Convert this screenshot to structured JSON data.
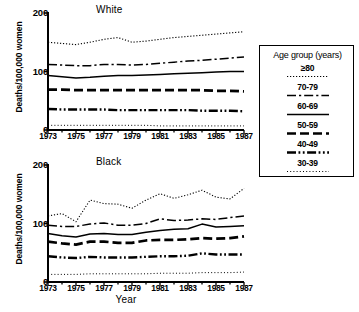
{
  "figure": {
    "xlabel": "Year",
    "ylabel": "Deaths/100,000 women"
  },
  "legend": {
    "title": "Age group (years)",
    "entries": [
      {
        "label": "≥80",
        "style": "dotted-fine"
      },
      {
        "label": "70-79",
        "style": "dash-dot"
      },
      {
        "label": "60-69",
        "style": "solid"
      },
      {
        "label": "50-59",
        "style": "dashed-thick"
      },
      {
        "label": "40-49",
        "style": "dash-dot-dot-thick"
      },
      {
        "label": "30-39",
        "style": "dotted-sparse"
      }
    ]
  },
  "chart_data": [
    {
      "type": "line",
      "title": "White",
      "xlabel": "Year",
      "ylabel": "Deaths/100,000 women",
      "x": [
        1973,
        1974,
        1975,
        1976,
        1977,
        1978,
        1979,
        1980,
        1981,
        1982,
        1983,
        1984,
        1985,
        1986,
        1987
      ],
      "xlim": [
        1973,
        1987
      ],
      "ylim": [
        0,
        200
      ],
      "yticks": [
        0,
        100,
        200
      ],
      "xticks": [
        1973,
        1975,
        1977,
        1979,
        1981,
        1983,
        1985,
        1987
      ],
      "grid": false,
      "legend_position": "right-outside",
      "series": [
        {
          "name": "≥80",
          "style": "dotted-fine",
          "values": [
            150,
            148,
            146,
            150,
            155,
            158,
            150,
            152,
            155,
            158,
            160,
            162,
            164,
            166,
            168
          ]
        },
        {
          "name": "70-79",
          "style": "dash-dot",
          "values": [
            112,
            111,
            110,
            110,
            112,
            112,
            111,
            112,
            114,
            116,
            118,
            119,
            121,
            123,
            125
          ]
        },
        {
          "name": "60-69",
          "style": "solid",
          "values": [
            93,
            91,
            89,
            90,
            92,
            93,
            93,
            94,
            95,
            96,
            97,
            98,
            99,
            100,
            100
          ]
        },
        {
          "name": "50-59",
          "style": "dashed-thick",
          "values": [
            69,
            69,
            68,
            68,
            68,
            68,
            68,
            68,
            68,
            68,
            68,
            68,
            67,
            67,
            66
          ]
        },
        {
          "name": "40-49",
          "style": "dash-dot-dot-thick",
          "values": [
            36,
            35,
            35,
            35,
            35,
            34,
            34,
            34,
            34,
            34,
            34,
            33,
            33,
            33,
            32
          ]
        },
        {
          "name": "30-39",
          "style": "dotted-sparse",
          "values": [
            8,
            8,
            8,
            8,
            8,
            8,
            8,
            8,
            7,
            7,
            7,
            7,
            7,
            7,
            7
          ]
        }
      ]
    },
    {
      "type": "line",
      "title": "Black",
      "xlabel": "Year",
      "ylabel": "Deaths/100,000 women",
      "x": [
        1973,
        1974,
        1975,
        1976,
        1977,
        1978,
        1979,
        1980,
        1981,
        1982,
        1983,
        1984,
        1985,
        1986,
        1987
      ],
      "xlim": [
        1973,
        1987
      ],
      "ylim": [
        0,
        200
      ],
      "yticks": [
        0,
        100,
        200
      ],
      "xticks": [
        1973,
        1975,
        1977,
        1979,
        1981,
        1983,
        1985,
        1987
      ],
      "grid": false,
      "legend_position": "right-outside",
      "series": [
        {
          "name": "≥80",
          "style": "dotted-fine",
          "values": [
            113,
            117,
            103,
            140,
            134,
            133,
            126,
            140,
            151,
            143,
            149,
            157,
            145,
            142,
            160
          ]
        },
        {
          "name": "70-79",
          "style": "dash-dot",
          "values": [
            97,
            95,
            95,
            99,
            101,
            97,
            97,
            100,
            108,
            105,
            106,
            108,
            107,
            110,
            113
          ]
        },
        {
          "name": "60-69",
          "style": "solid",
          "values": [
            83,
            79,
            77,
            82,
            83,
            81,
            81,
            85,
            88,
            90,
            91,
            99,
            94,
            95,
            96
          ]
        },
        {
          "name": "50-59",
          "style": "dashed-thick",
          "values": [
            69,
            66,
            64,
            69,
            69,
            67,
            67,
            71,
            72,
            72,
            73,
            75,
            74,
            75,
            78
          ]
        },
        {
          "name": "40-49",
          "style": "dash-dot-dot-thick",
          "values": [
            44,
            42,
            41,
            43,
            42,
            42,
            42,
            43,
            44,
            44,
            45,
            49,
            47,
            47,
            47
          ]
        },
        {
          "name": "30-39",
          "style": "dotted-sparse",
          "values": [
            13,
            13,
            13,
            14,
            14,
            14,
            14,
            14,
            15,
            15,
            15,
            16,
            16,
            16,
            17
          ]
        }
      ]
    }
  ]
}
